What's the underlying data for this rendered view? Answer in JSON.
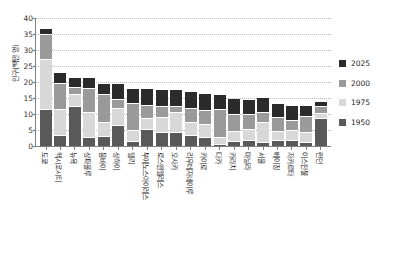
{
  "chart_data": {
    "type": "bar",
    "subtype": "stacked-column",
    "title": "",
    "xlabel": "",
    "ylabel": "인구(백만 명)",
    "ylim": [
      0,
      40
    ],
    "yticks": [
      0,
      5,
      10,
      15,
      20,
      25,
      30,
      35,
      40
    ],
    "grid": true,
    "legend_position": "right",
    "categories": [
      "도쿄",
      "멕시코시티",
      "뉴욕",
      "상파울루",
      "뭄바이",
      "상하이",
      "델리",
      "부에노스아이레스",
      "로스앤젤레스",
      "오사카",
      "리우데자네이루",
      "카이로",
      "다카",
      "카라치",
      "마닐라",
      "서울",
      "베이징",
      "자카르타",
      "이스탄불",
      "런던"
    ],
    "series": [
      {
        "name": "1950",
        "color": "#595959",
        "values": [
          11.3,
          3.1,
          12.3,
          2.4,
          2.9,
          6.1,
          1.4,
          5.1,
          4.0,
          4.1,
          3.0,
          2.4,
          0.4,
          1.1,
          1.5,
          1.0,
          1.7,
          1.5,
          1.0,
          8.4
        ]
      },
      {
        "name": "1975",
        "color": "#d8d8d8",
        "values": [
          15.2,
          7.8,
          3.4,
          7.6,
          4.1,
          5.2,
          3.1,
          3.0,
          4.3,
          5.8,
          4.0,
          3.9,
          1.7,
          2.9,
          3.1,
          5.9,
          2.5,
          3.0,
          2.7,
          1.3
        ]
      },
      {
        "name": "2000",
        "color": "#9a9a9a",
        "values": [
          7.5,
          8.0,
          1.9,
          7.2,
          8.2,
          2.5,
          7.9,
          3.8,
          3.3,
          1.7,
          3.8,
          3.9,
          8.4,
          5.2,
          4.6,
          2.8,
          3.8,
          2.8,
          4.9,
          2.0
        ]
      },
      {
        "name": "2025",
        "color": "#2b2b2b",
        "values": [
          1.5,
          3.0,
          2.8,
          3.2,
          3.2,
          4.5,
          4.6,
          5.0,
          5.0,
          5.0,
          5.0,
          5.0,
          4.5,
          4.5,
          4.4,
          4.5,
          4.3,
          4.3,
          3.0,
          1.0
        ]
      }
    ]
  },
  "legend": {
    "items": [
      {
        "label": "2025",
        "color": "#2b2b2b"
      },
      {
        "label": "2000",
        "color": "#9a9a9a"
      },
      {
        "label": "1975",
        "color": "#d8d8d8"
      },
      {
        "label": "1950",
        "color": "#595959"
      }
    ]
  }
}
